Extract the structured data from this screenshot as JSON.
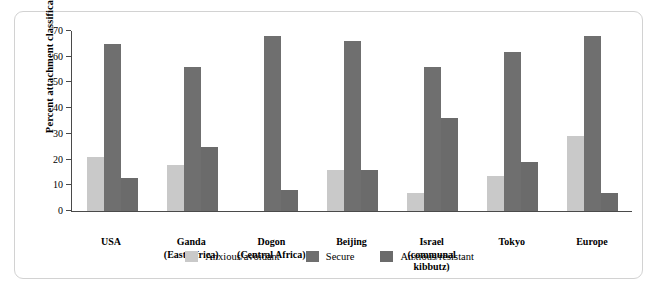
{
  "chart_data": {
    "type": "bar",
    "title": "",
    "xlabel": "",
    "ylabel": "Percent attachment classification",
    "ylim": [
      0,
      70
    ],
    "yticks": [
      0,
      10,
      20,
      30,
      40,
      50,
      60,
      70
    ],
    "ytick_labels": [
      "0",
      "10",
      "20",
      "30",
      "40",
      "50",
      "60",
      "70"
    ],
    "grid": false,
    "legend_position": "bottom-center",
    "categories": [
      "USA",
      "Ganda",
      "Dogon",
      "Beijing",
      "Israel",
      "Tokyo",
      "Europe"
    ],
    "category_sublabels": [
      "",
      "(East Africa)",
      "(Central Africa)",
      "",
      "(communal kibbutz)",
      "",
      ""
    ],
    "series": [
      {
        "name": "Anxious/avoidant",
        "color": "#c9c9c9",
        "values": [
          21,
          18,
          0,
          16,
          7,
          13.5,
          29
        ]
      },
      {
        "name": "Secure",
        "color": "#6f6f6f",
        "values": [
          65,
          56,
          68,
          66,
          56,
          62,
          68
        ]
      },
      {
        "name": "Anxious/resistant",
        "color": "#6b6b6b",
        "values": [
          13,
          25,
          8,
          16,
          36,
          19,
          7
        ]
      }
    ]
  },
  "frame": {
    "border_color": "#d2d2d2"
  }
}
